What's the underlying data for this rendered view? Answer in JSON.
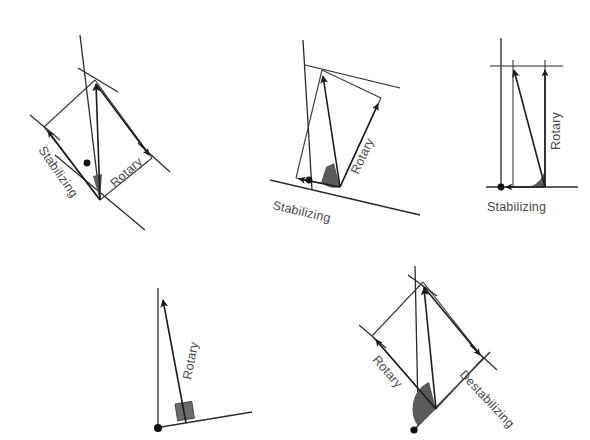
{
  "page": {
    "background_color": "#ffffff",
    "width": 590,
    "height": 440
  },
  "style": {
    "line_color": "#2b2b2b",
    "vector_color": "#1c1c1c",
    "wedge_color": "#5a5a5a",
    "label_color": "#4a4a4a",
    "pivot_color": "#111111"
  },
  "figures": [
    {
      "id": "figure-top-left",
      "position": "top-left",
      "labels": {
        "stabilizing": "Stabilizing",
        "rotary": "Rotary"
      },
      "angle_marker": "narrow-acute-wedge",
      "has_pivot_dot": true,
      "components": [
        "muscle-force-vector",
        "rotary-component",
        "stabilizing-component",
        "bone-axis",
        "joint-axis"
      ]
    },
    {
      "id": "figure-top-center",
      "position": "top-center",
      "labels": {
        "stabilizing": "Stabilizing",
        "rotary": "Rotary"
      },
      "angle_marker": "obtuse-wedge",
      "has_pivot_dot": true,
      "components": [
        "muscle-force-vector",
        "rotary-component",
        "stabilizing-component",
        "bone-axis",
        "joint-axis"
      ]
    },
    {
      "id": "figure-top-right",
      "position": "top-right",
      "labels": {
        "stabilizing": "Stabilizing",
        "rotary": "Rotary"
      },
      "angle_marker": "acute-wedge",
      "has_pivot_dot": true,
      "components": [
        "muscle-force-vector",
        "rotary-component",
        "stabilizing-component",
        "bone-axis",
        "joint-axis"
      ]
    },
    {
      "id": "figure-bottom-left",
      "position": "bottom-left",
      "labels": {
        "rotary": "Rotary"
      },
      "angle_marker": "right-angle-square",
      "has_pivot_dot": true,
      "components": [
        "muscle-force-vector",
        "bone-axis",
        "joint-axis"
      ]
    },
    {
      "id": "figure-bottom-right",
      "position": "bottom-right",
      "labels": {
        "rotary": "Rotary",
        "destabilizing": "Destabilizing"
      },
      "angle_marker": "large-obtuse-wedge",
      "has_pivot_dot": true,
      "components": [
        "muscle-force-vector",
        "rotary-component",
        "destabilizing-component",
        "bone-axis",
        "joint-axis"
      ]
    }
  ]
}
